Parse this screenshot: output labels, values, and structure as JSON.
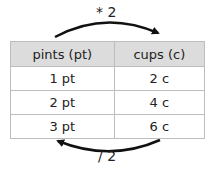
{
  "diagram": {
    "top_operation": "* 2",
    "bottom_operation": "/ 2",
    "table": {
      "headers": [
        "pints (pt)",
        "cups (c)"
      ],
      "rows": [
        [
          "1 pt",
          "2 c"
        ],
        [
          "2 pt",
          "4 c"
        ],
        [
          "3 pt",
          "6 c"
        ]
      ]
    },
    "colors": {
      "header_bg": "#dcdcdc",
      "border": "#bdbdbd",
      "arrow": "#111111"
    }
  }
}
